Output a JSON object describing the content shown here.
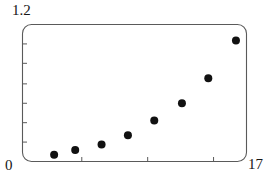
{
  "figure": {
    "background_color": "#ffffff",
    "frame_color": "#5a5a5a",
    "marker_color": "#111111"
  },
  "axis_labels": {
    "y_max": "1.2",
    "y_min": "0",
    "x_max": "17"
  },
  "chart_data": {
    "type": "scatter",
    "title": "",
    "xlabel": "",
    "ylabel": "",
    "xlim": [
      0,
      17
    ],
    "ylim": [
      0,
      1.2
    ],
    "grid": false,
    "legend": null,
    "x_tick_labels": [
      "0",
      "17"
    ],
    "y_tick_labels": [
      "0",
      "1.2"
    ],
    "x_ticks_minor": [
      4.5,
      9.5,
      14.5
    ],
    "y_ticks_minor": [
      0.17,
      0.34,
      0.51,
      0.68,
      0.86,
      1.03
    ],
    "marker": "circle",
    "marker_size": 4,
    "points": [
      {
        "x": 2.4,
        "y": 0.06
      },
      {
        "x": 4.0,
        "y": 0.1
      },
      {
        "x": 6.0,
        "y": 0.15
      },
      {
        "x": 8.0,
        "y": 0.23
      },
      {
        "x": 10.0,
        "y": 0.36
      },
      {
        "x": 12.1,
        "y": 0.51
      },
      {
        "x": 14.1,
        "y": 0.73
      },
      {
        "x": 16.2,
        "y": 1.06
      }
    ],
    "x": [
      2.4,
      4.0,
      6.0,
      8.0,
      10.0,
      12.1,
      14.1,
      16.2
    ],
    "values": [
      0.06,
      0.1,
      0.15,
      0.23,
      0.36,
      0.51,
      0.73,
      1.06
    ]
  }
}
